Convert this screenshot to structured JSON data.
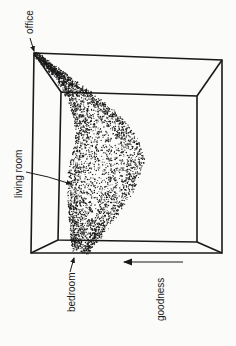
{
  "diagram": {
    "type": "3d-surface-in-box",
    "labels": {
      "office": "office",
      "living_room": "living room",
      "bedroom": "bedroom",
      "axis": "goodness"
    },
    "colors": {
      "ink": "#1a1a1a",
      "background": "#fbfbf9"
    }
  }
}
